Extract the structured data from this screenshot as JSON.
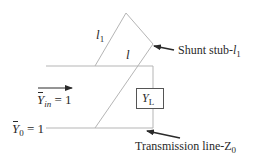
{
  "diagram": {
    "type": "single-stub shunt matching network",
    "labels": {
      "stub_length": "l",
      "stub_length_sub": "1",
      "distance": "l",
      "shunt_stub_text": "Shunt stub-",
      "shunt_stub_var": "l",
      "shunt_stub_sub": "1",
      "yin_var": "Y",
      "yin_sub": "in",
      "yin_eq": " = 1",
      "y0_var": "Y",
      "y0_sub": "0",
      "y0_eq": " = 1",
      "load_var": "Y",
      "load_sub": "L",
      "tline_text": "Transmission line-Z",
      "tline_sub": "0"
    },
    "colors": {
      "line": "#b8b8b8",
      "arrow": "#2a2a2a",
      "text": "#2a2a2a"
    }
  }
}
